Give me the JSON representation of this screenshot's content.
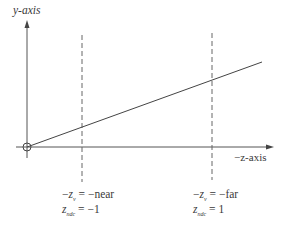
{
  "diagram": {
    "y_axis_label": "y-axis",
    "x_axis_label": "−z-axis",
    "near_plane": {
      "line1_prefix": "−",
      "line1_var": "z",
      "line1_sub": "v",
      "line1_rhs": " = −near",
      "line2_var": "z",
      "line2_sub": "ndc",
      "line2_rhs": " = −1"
    },
    "far_plane": {
      "line1_prefix": "−",
      "line1_var": "z",
      "line1_sub": "v",
      "line1_rhs": " = −far",
      "line2_var": "z",
      "line2_sub": "ndc",
      "line2_rhs": " = 1"
    },
    "colors": {
      "stroke": "#4a4a4a",
      "text": "#3a3a3a",
      "background": "#ffffff"
    }
  }
}
